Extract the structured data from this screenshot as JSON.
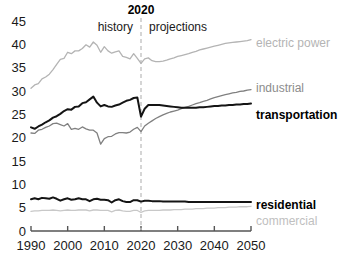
{
  "chart_data": {
    "type": "line",
    "title": "",
    "subtitle": "",
    "xlabel": "",
    "ylabel": "",
    "xlim": [
      1990,
      2050
    ],
    "ylim": [
      0,
      45
    ],
    "grid": false,
    "legend_position": "right-inline",
    "xticks": [
      "1990",
      "2000",
      "2010",
      "2020",
      "2030",
      "2040",
      "2050"
    ],
    "yticks": [
      "0",
      "5",
      "10",
      "15",
      "20",
      "25",
      "30",
      "35",
      "40",
      "45"
    ],
    "annotations": [
      {
        "name": "divider-year",
        "text": "2020",
        "bold": true
      },
      {
        "name": "history-label",
        "text": "history",
        "bold": false
      },
      {
        "name": "projections-label",
        "text": "projections",
        "bold": false
      }
    ],
    "divider_x": 2020,
    "x": [
      1990,
      1991,
      1992,
      1993,
      1994,
      1995,
      1996,
      1997,
      1998,
      1999,
      2000,
      2001,
      2002,
      2003,
      2004,
      2005,
      2006,
      2007,
      2008,
      2009,
      2010,
      2011,
      2012,
      2013,
      2014,
      2015,
      2016,
      2017,
      2018,
      2019,
      2020,
      2021,
      2022,
      2023,
      2024,
      2025,
      2026,
      2027,
      2028,
      2029,
      2030,
      2031,
      2032,
      2033,
      2034,
      2035,
      2036,
      2037,
      2038,
      2039,
      2040,
      2041,
      2042,
      2043,
      2044,
      2045,
      2046,
      2047,
      2048,
      2049,
      2050
    ],
    "series": [
      {
        "name": "electric power",
        "color": "#b4b4b4",
        "label_color": "#b4b4b4",
        "bold_label": false,
        "values": [
          30.6,
          31.3,
          31.6,
          32.6,
          33.0,
          33.6,
          34.6,
          35.7,
          36.8,
          37.0,
          38.3,
          38.0,
          38.6,
          38.6,
          39.1,
          39.9,
          39.4,
          40.5,
          39.8,
          38.3,
          39.5,
          38.6,
          38.1,
          38.4,
          38.6,
          37.4,
          37.2,
          36.9,
          38.0,
          37.0,
          35.9,
          36.9,
          37.1,
          36.5,
          36.3,
          36.3,
          36.4,
          36.6,
          36.9,
          37.1,
          37.4,
          37.6,
          37.8,
          38.0,
          38.3,
          38.5,
          38.8,
          39.0,
          39.2,
          39.4,
          39.6,
          39.8,
          40.0,
          40.2,
          40.3,
          40.4,
          40.5,
          40.6,
          40.7,
          40.8,
          41.0
        ]
      },
      {
        "name": "industrial",
        "color": "#808080",
        "label_color": "#8c8c8c",
        "bold_label": false,
        "values": [
          21.0,
          20.9,
          21.6,
          21.8,
          22.2,
          22.5,
          23.0,
          23.1,
          22.8,
          22.5,
          23.0,
          21.8,
          22.0,
          21.8,
          22.3,
          21.9,
          21.6,
          21.6,
          21.0,
          18.6,
          19.8,
          20.2,
          20.3,
          20.8,
          21.1,
          21.1,
          21.0,
          21.2,
          21.8,
          22.2,
          21.3,
          22.5,
          23.1,
          23.6,
          24.1,
          24.5,
          24.9,
          25.2,
          25.5,
          25.7,
          25.9,
          26.2,
          26.5,
          26.7,
          27.0,
          27.3,
          27.5,
          27.8,
          28.0,
          28.3,
          28.6,
          28.8,
          29.0,
          29.2,
          29.4,
          29.6,
          29.7,
          29.9,
          30.0,
          30.2,
          30.3
        ]
      },
      {
        "name": "transportation",
        "color": "#141414",
        "label_color": "#000000",
        "bold_label": true,
        "values": [
          22.2,
          21.9,
          22.4,
          22.8,
          23.3,
          23.7,
          24.3,
          24.6,
          25.1,
          25.7,
          26.1,
          26.0,
          26.6,
          26.7,
          27.4,
          27.6,
          28.2,
          28.8,
          27.5,
          26.7,
          27.0,
          26.7,
          26.6,
          26.9,
          27.1,
          27.5,
          27.9,
          28.1,
          28.5,
          28.6,
          24.5,
          26.2,
          27.0,
          27.0,
          27.0,
          27.0,
          26.9,
          26.8,
          26.7,
          26.6,
          26.5,
          26.4,
          26.4,
          26.4,
          26.4,
          26.4,
          26.5,
          26.5,
          26.6,
          26.7,
          26.8,
          26.8,
          26.9,
          26.9,
          27.0,
          27.0,
          27.1,
          27.1,
          27.2,
          27.2,
          27.3
        ]
      },
      {
        "name": "residential",
        "color": "#141414",
        "label_color": "#000000",
        "bold_label": true,
        "values": [
          6.8,
          7.0,
          6.8,
          7.1,
          7.0,
          6.9,
          7.2,
          6.9,
          6.5,
          6.8,
          7.0,
          6.7,
          6.8,
          7.0,
          6.8,
          6.8,
          6.4,
          6.8,
          6.9,
          6.7,
          6.7,
          6.6,
          6.1,
          6.6,
          6.8,
          6.4,
          6.2,
          6.2,
          6.6,
          6.6,
          6.3,
          6.5,
          6.5,
          6.4,
          6.4,
          6.4,
          6.3,
          6.3,
          6.3,
          6.3,
          6.3,
          6.3,
          6.3,
          6.2,
          6.2,
          6.2,
          6.2,
          6.2,
          6.2,
          6.2,
          6.2,
          6.2,
          6.2,
          6.2,
          6.2,
          6.2,
          6.2,
          6.2,
          6.2,
          6.2,
          6.2
        ]
      },
      {
        "name": "commercial",
        "color": "#c8c8c8",
        "label_color": "#c0c0c0",
        "bold_label": false,
        "values": [
          4.2,
          4.3,
          4.3,
          4.4,
          4.4,
          4.4,
          4.5,
          4.4,
          4.3,
          4.4,
          4.5,
          4.4,
          4.4,
          4.5,
          4.5,
          4.5,
          4.3,
          4.5,
          4.5,
          4.4,
          4.4,
          4.4,
          4.1,
          4.4,
          4.5,
          4.3,
          4.2,
          4.2,
          4.4,
          4.4,
          4.0,
          4.3,
          4.4,
          4.4,
          4.4,
          4.4,
          4.5,
          4.5,
          4.5,
          4.6,
          4.6,
          4.6,
          4.7,
          4.7,
          4.7,
          4.8,
          4.8,
          4.8,
          4.9,
          4.9,
          4.9,
          5.0,
          5.0,
          5.0,
          5.1,
          5.1,
          5.1,
          5.2,
          5.2,
          5.2,
          5.3
        ]
      }
    ]
  }
}
